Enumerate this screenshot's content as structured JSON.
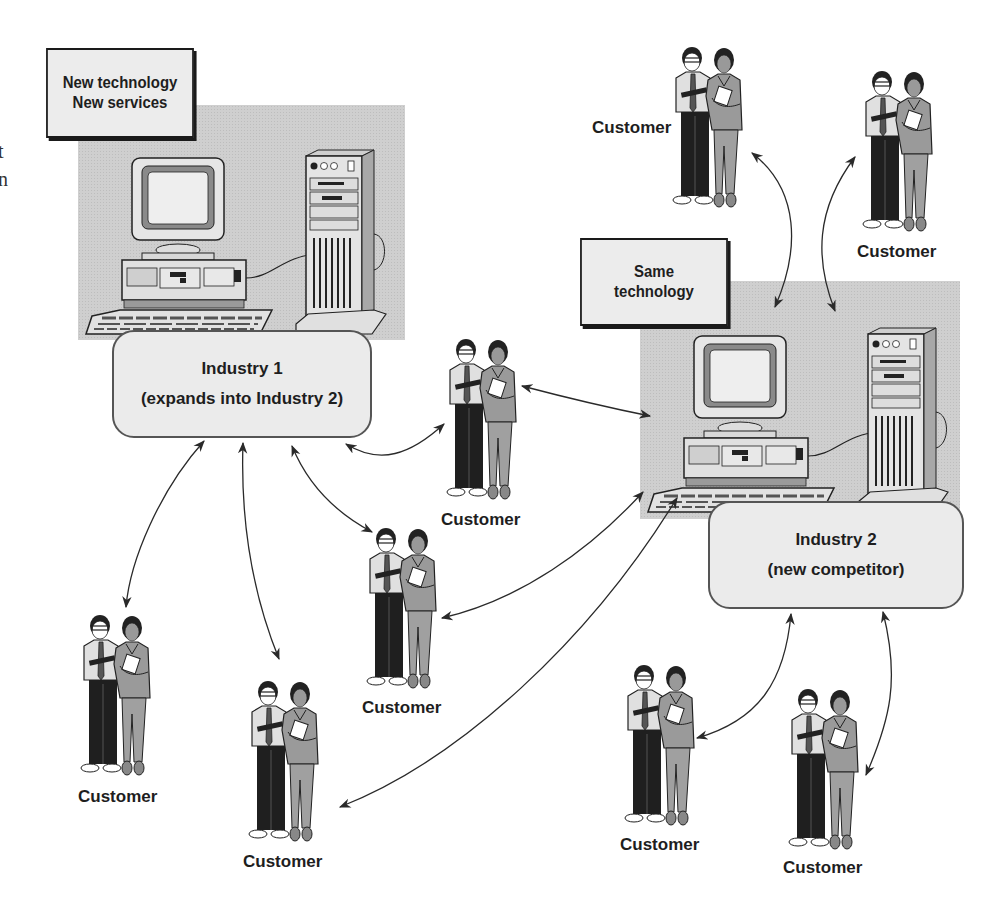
{
  "edge_text_fragments": [
    "t",
    "n"
  ],
  "callouts": {
    "new_tech": {
      "lines": [
        "New technology",
        "New services"
      ]
    },
    "same_tech": {
      "lines": [
        "Same",
        "technology"
      ]
    }
  },
  "industries": {
    "industry1": {
      "lines": [
        "Industry 1",
        "(expands into Industry 2)"
      ]
    },
    "industry2": {
      "lines": [
        "Industry 2",
        "(new competitor)"
      ]
    }
  },
  "customers": [
    {
      "id": "top-center",
      "label": "Customer"
    },
    {
      "id": "top-right",
      "label": "Customer"
    },
    {
      "id": "middle",
      "label": "Customer"
    },
    {
      "id": "mid-lower",
      "label": "Customer"
    },
    {
      "id": "bottom-left",
      "label": "Customer"
    },
    {
      "id": "bottom-center",
      "label": "Customer"
    },
    {
      "id": "bottom-right-1",
      "label": "Customer"
    },
    {
      "id": "bottom-right-2",
      "label": "Customer"
    }
  ],
  "colors": {
    "panel_gray": "#cfcfcf",
    "box_fill": "#ebebeb",
    "ink": "#1e1e1e",
    "arrow": "#333333"
  }
}
